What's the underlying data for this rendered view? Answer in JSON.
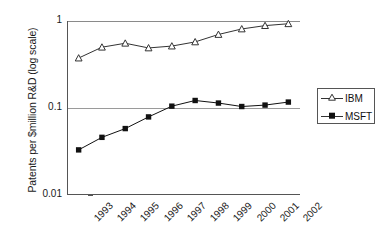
{
  "chart_data": {
    "type": "line",
    "title": "",
    "subtitle": "",
    "xlabel": "",
    "ylabel": "Patents per $million R&D (log scale)",
    "scale": "log",
    "grid": true,
    "legend_position": "right",
    "categories": [
      "1993",
      "1994",
      "1995",
      "1996",
      "1997",
      "1998",
      "1999",
      "2000",
      "2001",
      "2002"
    ],
    "ylim": [
      0.01,
      1
    ],
    "yticks": [
      {
        "value": 1,
        "label": "1"
      },
      {
        "value": 0.1,
        "label": "0.1"
      },
      {
        "value": 0.01,
        "label": "0.01"
      }
    ],
    "series": [
      {
        "name": "IBM",
        "marker": "open-triangle",
        "color": "#333333",
        "values": [
          0.375,
          0.5,
          0.555,
          0.49,
          0.515,
          0.575,
          0.7,
          0.81,
          0.885,
          0.93
        ]
      },
      {
        "name": "MSFT",
        "marker": "filled-square",
        "color": "#111111",
        "values": [
          0.033,
          0.046,
          0.058,
          0.079,
          0.105,
          0.122,
          0.114,
          0.104,
          0.108,
          0.117
        ]
      }
    ]
  },
  "legend": {
    "title": "",
    "entries": [
      {
        "label": "IBM",
        "marker": "open-triangle"
      },
      {
        "label": "MSFT",
        "marker": "filled-square"
      }
    ]
  },
  "axes": {
    "y_title": "Patents per $million R&D (log scale)",
    "y_tick_labels": [
      "1",
      "0.1",
      "0.01"
    ],
    "x_tick_labels": [
      "1993",
      "1994",
      "1995",
      "1996",
      "1997",
      "1998",
      "1999",
      "2000",
      "2001",
      "2002"
    ]
  }
}
